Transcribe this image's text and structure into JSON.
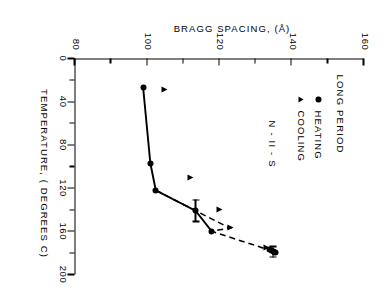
{
  "figure": {
    "legend_title": "LONG  PERIOD",
    "sample_label": "N - II - S",
    "legend": [
      {
        "key": "filled-circle",
        "label": "HEATING"
      },
      {
        "key": "open-triangle",
        "label": "COOLING"
      }
    ]
  },
  "chart_data": {
    "type": "line",
    "title": "LONG  PERIOD",
    "annotation": "N - II - S",
    "xlabel": "TEMPERATURE, ( DEGREES  C)",
    "ylabel": "BRAGG SPACING, (Å)",
    "xlim": [
      0,
      200
    ],
    "ylim": [
      80,
      160
    ],
    "xticks": [
      0,
      40,
      80,
      120,
      160,
      200
    ],
    "yticks": [
      80,
      100,
      120,
      140,
      160
    ],
    "xtick_labels": [
      "0",
      "40",
      "80",
      "120",
      "160",
      "200"
    ],
    "ytick_labels": [
      "80",
      "100",
      "120",
      "140",
      "160"
    ],
    "xminor_step": 20,
    "yminor_step": 10,
    "grid": false,
    "legend_position": "upper-left",
    "series": [
      {
        "name": "HEATING",
        "marker": "filled-circle",
        "linestyle": "solid",
        "points": [
          {
            "x": 27,
            "y": 99
          },
          {
            "x": 97,
            "y": 101
          },
          {
            "x": 122,
            "y": 102.5
          },
          {
            "x": 141,
            "y": 113.5
          },
          {
            "x": 160,
            "y": 118
          },
          {
            "x": 177,
            "y": 134
          },
          {
            "x": 178,
            "y": 134.5
          },
          {
            "x": 179,
            "y": 135
          },
          {
            "x": 180,
            "y": 135.5
          }
        ],
        "errorbars": [
          {
            "x": 141,
            "y": 113.5,
            "yerr": 3.0
          },
          {
            "x": 179,
            "y": 135,
            "yerr": 1.5
          }
        ]
      },
      {
        "name": "COOLING",
        "marker": "open-triangle",
        "linestyle": "dashed",
        "points": [
          {
            "x": 29,
            "y": 105
          },
          {
            "x": 111,
            "y": 112
          },
          {
            "x": 140,
            "y": 120
          },
          {
            "x": 157,
            "y": 123
          },
          {
            "x": 176,
            "y": 133
          }
        ]
      }
    ],
    "connecting_lines": [
      {
        "name": "heating-solid",
        "style": "solid",
        "points": [
          {
            "x": 27,
            "y": 99
          },
          {
            "x": 97,
            "y": 101
          },
          {
            "x": 122,
            "y": 102.5
          },
          {
            "x": 141,
            "y": 113.5
          },
          {
            "x": 160,
            "y": 118
          }
        ]
      },
      {
        "name": "cooling-dashed",
        "style": "dashed",
        "points": [
          {
            "x": 122,
            "y": 102.5
          },
          {
            "x": 141,
            "y": 113.5
          },
          {
            "x": 157,
            "y": 123
          },
          {
            "x": 160,
            "y": 118
          },
          {
            "x": 178,
            "y": 134.5
          }
        ]
      }
    ]
  }
}
